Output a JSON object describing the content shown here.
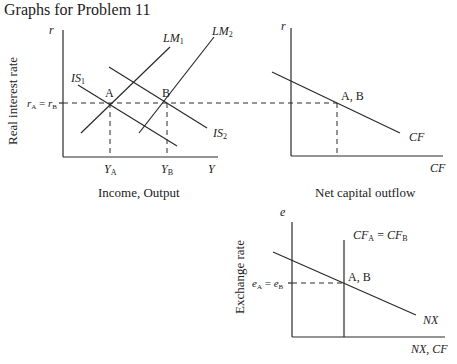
{
  "title": "Graphs for Problem 11",
  "panels": {
    "islm": {
      "y_axis_symbol": "r",
      "x_axis_symbol": "Y",
      "y_axis_label": "Real interest rate",
      "x_axis_label": "Income, Output",
      "curves": {
        "lm1": "LM",
        "lm1_sub": "1",
        "lm2": "LM",
        "lm2_sub": "2",
        "is1": "IS",
        "is1_sub": "1",
        "is2": "IS",
        "is2_sub": "2"
      },
      "points": {
        "a": "A",
        "b": "B"
      },
      "ticks": {
        "r_main": "r",
        "r_a_sub": "A",
        "r_eq": " = ",
        "r_b_sub": "B",
        "ya": "Y",
        "ya_sub": "A",
        "yb": "Y",
        "yb_sub": "B"
      }
    },
    "cf": {
      "y_axis_symbol": "r",
      "x_axis_symbol": "CF",
      "x_axis_label": "Net capital outflow",
      "curve": "CF",
      "point": "A, B"
    },
    "exchange": {
      "y_axis_symbol": "e",
      "x_axis_symbol": "NX, CF",
      "y_axis_label": "Exchange rate",
      "curve_nx": "NX",
      "cf_line": {
        "a": "CF",
        "a_sub": "A",
        "eq": " = ",
        "b": "CF",
        "b_sub": "B"
      },
      "point": "A, B",
      "tick": {
        "e_main": "e",
        "e_a_sub": "A",
        "eq": " = ",
        "e_b_sub": "B"
      }
    }
  },
  "colors": {
    "line": "#2a2a2a",
    "text": "#222222",
    "background": "#ffffff"
  }
}
